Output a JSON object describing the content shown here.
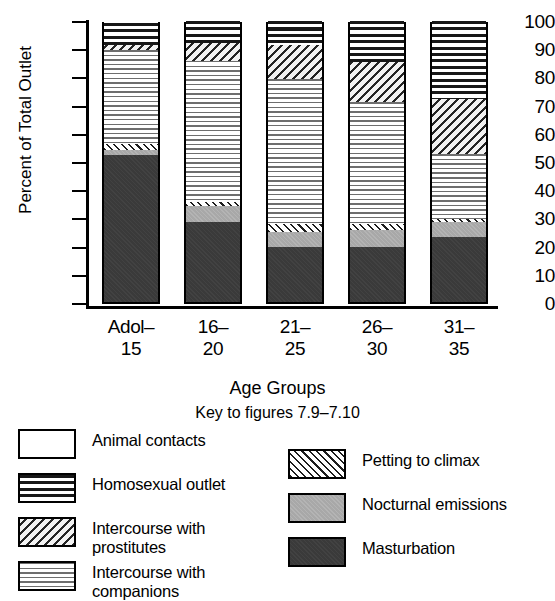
{
  "chart_data": {
    "type": "bar",
    "subtype": "stacked-percentage",
    "title": "",
    "xlabel": "Age Groups",
    "ylabel": "Percent of Total Outlet",
    "ylim": [
      0,
      100
    ],
    "ytick_labels": [
      "100",
      "90",
      "80",
      "70",
      "60",
      "50",
      "40",
      "30",
      "20",
      "10",
      "0"
    ],
    "ytick_values": [
      100,
      90,
      80,
      70,
      60,
      50,
      40,
      30,
      20,
      10,
      0
    ],
    "grid": false,
    "legend_position": "below-plot",
    "categories": [
      "Adol-15",
      "16-20",
      "21-25",
      "26-30",
      "31-35"
    ],
    "category_lines": [
      [
        "Adol–",
        "15"
      ],
      [
        "16–",
        "20"
      ],
      [
        "21–",
        "25"
      ],
      [
        "26–",
        "30"
      ],
      [
        "31–",
        "35"
      ]
    ],
    "stack_order_bottom_to_top": [
      "Masturbation",
      "Nocturnal emissions",
      "Petting to climax",
      "Intercourse with companions",
      "Intercourse with prostitutes",
      "Homosexual outlet",
      "Animal contacts"
    ],
    "series": [
      {
        "name": "Masturbation",
        "pattern": "solid-dark",
        "values": [
          52.0,
          28.5,
          19.5,
          19.5,
          23.0
        ]
      },
      {
        "name": "Nocturnal emissions",
        "pattern": "solid-gray",
        "values": [
          2.0,
          5.5,
          5.5,
          6.0,
          5.5
        ]
      },
      {
        "name": "Petting to climax",
        "pattern": "diagonal-thin",
        "values": [
          2.0,
          1.5,
          2.5,
          2.0,
          1.0
        ]
      },
      {
        "name": "Intercourse with companions",
        "pattern": "horizontal-light",
        "values": [
          33.5,
          50.0,
          51.5,
          43.5,
          23.0
        ]
      },
      {
        "name": "Intercourse with prostitutes",
        "pattern": "diagonal-coarse",
        "values": [
          1.5,
          6.5,
          12.0,
          14.0,
          19.5
        ]
      },
      {
        "name": "Homosexual outlet",
        "pattern": "horizontal-bold",
        "values": [
          8.0,
          7.5,
          8.5,
          14.5,
          27.5
        ]
      },
      {
        "name": "Animal contacts",
        "pattern": "white",
        "values": [
          1.0,
          0.5,
          0.5,
          0.5,
          0.5
        ]
      }
    ],
    "cumulative_tops": [
      [
        52.0,
        54.0,
        56.0,
        89.5,
        91.0,
        99.0,
        100.0
      ],
      [
        28.5,
        34.0,
        35.5,
        85.5,
        92.0,
        99.5,
        100.0
      ],
      [
        19.5,
        25.0,
        27.5,
        79.0,
        91.0,
        99.5,
        100.0
      ],
      [
        19.5,
        25.5,
        27.5,
        71.0,
        85.0,
        99.5,
        100.0
      ],
      [
        23.0,
        28.5,
        29.5,
        52.5,
        72.0,
        99.5,
        100.0
      ]
    ]
  },
  "axis": {
    "y_title": "Percent of Total Outlet",
    "x_title": "Age Groups"
  },
  "key": {
    "title": "Key to figures 7.9–7.10",
    "left_items": [
      {
        "label_lines": [
          "Animal contacts"
        ],
        "pattern": "white"
      },
      {
        "label_lines": [
          "Homosexual outlet"
        ],
        "pattern": "horizontal-bold"
      },
      {
        "label_lines": [
          "Intercourse with",
          "prostitutes"
        ],
        "pattern": "diagonal-coarse"
      },
      {
        "label_lines": [
          "Intercourse with",
          "companions"
        ],
        "pattern": "horizontal-light"
      }
    ],
    "right_items": [
      {
        "label_lines": [
          "Petting to climax"
        ],
        "pattern": "diagonal-thin"
      },
      {
        "label_lines": [
          "Nocturnal emissions"
        ],
        "pattern": "solid-gray"
      },
      {
        "label_lines": [
          "Masturbation"
        ],
        "pattern": "solid-dark"
      }
    ]
  },
  "colors": {
    "ink": "#000000",
    "background": "#ffffff",
    "masturbation": "#3a3a3a",
    "nocturnal": "#a8a8a8",
    "hatch": "#1d1d1d"
  }
}
